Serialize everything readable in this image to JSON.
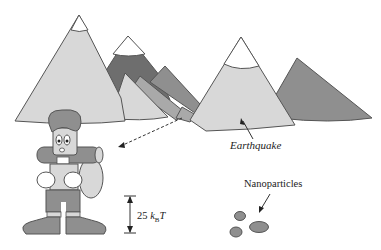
{
  "diagram": {
    "labels": {
      "earthquake": "Earthquake",
      "nanoparticles": "Nanoparticles",
      "energy_value": "25 ",
      "energy_k": "k",
      "energy_sub": "B",
      "energy_T": "T"
    },
    "colors": {
      "light_fill": "#d8d8d8",
      "mid_fill": "#a9a9a9",
      "dark_fill": "#6e6e6e",
      "medium_fill": "#8f8f8f",
      "snow": "#ffffff",
      "stroke": "#555555"
    }
  }
}
